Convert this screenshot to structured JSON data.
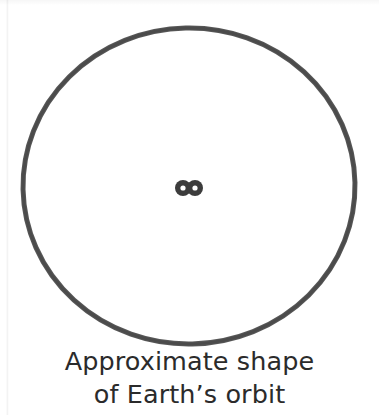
{
  "figure": {
    "background_color": "#ffffff",
    "caption": {
      "line1": "Approximate shape",
      "line2": "of Earth’s orbit",
      "color": "#2b2b2b",
      "align": "center"
    },
    "orbit": {
      "shape_name": "orbit-ellipse",
      "description": "Approximate shape of Earth's orbit",
      "stroke_color": "#4a4a4a",
      "fill": "none",
      "stroke_width": 5,
      "center_x": 189,
      "center_y": 186,
      "radius_x": 166,
      "radius_y": 158
    },
    "center_marks": {
      "name": "orbit-foci-marks",
      "count": 2,
      "color": "#3c3c3c",
      "inner_color": "#ffffff",
      "items": [
        {
          "label": "focus-left",
          "cx": 183,
          "cy": 188,
          "r": 8,
          "inner_r": 2.6
        },
        {
          "label": "focus-right",
          "cx": 195,
          "cy": 188,
          "r": 8,
          "inner_r": 2.6
        }
      ]
    }
  }
}
